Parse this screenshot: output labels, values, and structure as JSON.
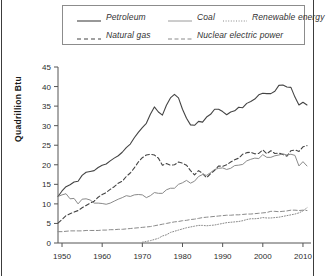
{
  "figure": {
    "ylabel": "Quadrillion Btu"
  },
  "legend": {
    "entries": [
      {
        "label": "Petroleum",
        "style": "solid",
        "color": "#444444",
        "icon": "legend-line-solid"
      },
      {
        "label": "Coal",
        "style": "solid-light",
        "color": "#8a8a8a",
        "icon": "legend-line-solid"
      },
      {
        "label": "Renewable energy",
        "style": "dotted",
        "color": "#8a8a8a",
        "icon": "legend-line-dotted"
      },
      {
        "label": "Natural gas",
        "style": "dashed",
        "color": "#444444",
        "icon": "legend-line-dashed"
      },
      {
        "label": "Nuclear electric power",
        "style": "dash-dot",
        "color": "#8a8a8a",
        "icon": "legend-line-dashdot"
      }
    ]
  },
  "chart_data": {
    "type": "line",
    "title": "",
    "xlabel": "",
    "ylabel": "Quadrillion Btu",
    "xlim": [
      1949,
      2012
    ],
    "ylim": [
      0,
      45
    ],
    "ytick_labels": [
      "0",
      "5",
      "10",
      "15",
      "20",
      "25",
      "30",
      "35",
      "40",
      "45"
    ],
    "yticks": [
      0,
      5,
      10,
      15,
      20,
      25,
      30,
      35,
      40,
      45
    ],
    "xtick_labels": [
      "1950",
      "1960",
      "1970",
      "1980",
      "1990",
      "2000",
      "2010"
    ],
    "xticks": [
      1950,
      1960,
      1970,
      1980,
      1990,
      2000,
      2010
    ],
    "grid": false,
    "legend_position": "top",
    "x": [
      1949,
      1950,
      1951,
      1952,
      1953,
      1954,
      1955,
      1956,
      1957,
      1958,
      1959,
      1960,
      1961,
      1962,
      1963,
      1964,
      1965,
      1966,
      1967,
      1968,
      1969,
      1970,
      1971,
      1972,
      1973,
      1974,
      1975,
      1976,
      1977,
      1978,
      1979,
      1980,
      1981,
      1982,
      1983,
      1984,
      1985,
      1986,
      1987,
      1988,
      1989,
      1990,
      1991,
      1992,
      1993,
      1994,
      1995,
      1996,
      1997,
      1998,
      1999,
      2000,
      2001,
      2002,
      2003,
      2004,
      2005,
      2006,
      2007,
      2008,
      2009,
      2010,
      2011
    ],
    "series": [
      {
        "name": "Petroleum",
        "style": "solid",
        "color": "#444444",
        "values": [
          11.9,
          13.3,
          14.4,
          14.9,
          15.6,
          15.8,
          17.3,
          18.1,
          18.3,
          18.5,
          19.3,
          19.9,
          20.2,
          21.0,
          21.7,
          22.3,
          23.2,
          24.4,
          25.3,
          26.9,
          28.3,
          29.5,
          30.6,
          32.9,
          34.8,
          33.5,
          32.7,
          35.2,
          37.1,
          38.0,
          37.1,
          34.2,
          31.9,
          30.2,
          30.1,
          31.1,
          30.9,
          32.2,
          32.9,
          34.2,
          34.2,
          33.6,
          32.8,
          33.5,
          33.8,
          34.7,
          34.6,
          35.7,
          36.2,
          36.8,
          37.9,
          38.3,
          38.2,
          38.2,
          38.8,
          40.3,
          40.4,
          39.9,
          39.8,
          37.3,
          35.3,
          36.0,
          35.3
        ]
      },
      {
        "name": "Natural gas",
        "style": "dashed",
        "color": "#444444",
        "values": [
          5.1,
          6.0,
          7.0,
          7.5,
          7.9,
          8.3,
          9.0,
          9.6,
          10.2,
          10.7,
          11.7,
          12.4,
          12.9,
          13.7,
          14.4,
          15.3,
          15.8,
          17.0,
          17.9,
          19.2,
          20.7,
          21.8,
          22.5,
          22.7,
          22.5,
          21.7,
          19.9,
          20.3,
          19.9,
          20.0,
          20.7,
          20.4,
          19.9,
          18.5,
          17.4,
          18.5,
          17.8,
          16.7,
          17.7,
          18.6,
          19.7,
          19.6,
          20.0,
          20.7,
          21.3,
          21.7,
          22.7,
          23.1,
          23.2,
          22.8,
          22.9,
          23.8,
          22.8,
          23.6,
          22.9,
          23.0,
          22.6,
          22.2,
          23.6,
          23.8,
          23.4,
          24.6,
          24.9
        ]
      },
      {
        "name": "Coal",
        "style": "solid-light",
        "color": "#8a8a8a",
        "values": [
          11.9,
          12.3,
          12.6,
          11.3,
          11.4,
          10.0,
          11.2,
          11.3,
          11.0,
          10.2,
          10.2,
          10.1,
          9.9,
          10.2,
          10.7,
          11.2,
          11.6,
          12.1,
          11.9,
          12.3,
          12.4,
          12.3,
          11.6,
          12.1,
          12.9,
          12.7,
          12.7,
          13.6,
          14.0,
          14.0,
          15.0,
          15.4,
          16.0,
          15.3,
          15.8,
          17.0,
          17.5,
          17.3,
          18.0,
          18.8,
          19.1,
          19.2,
          18.8,
          19.1,
          19.8,
          19.9,
          20.1,
          21.0,
          21.4,
          21.7,
          21.6,
          22.6,
          21.9,
          21.9,
          22.3,
          22.5,
          22.8,
          22.5,
          22.7,
          22.4,
          19.7,
          20.8,
          19.7
        ]
      },
      {
        "name": "Nuclear electric power",
        "style": "dash-dot",
        "color": "#8a8a8a",
        "values": [
          2.9,
          2.9,
          3.0,
          3.1,
          3.1,
          3.1,
          3.1,
          3.2,
          3.2,
          3.2,
          3.2,
          3.3,
          3.3,
          3.4,
          3.4,
          3.5,
          3.5,
          3.6,
          3.7,
          3.8,
          3.9,
          4.0,
          4.1,
          4.2,
          4.4,
          4.6,
          4.8,
          5.0,
          5.2,
          5.4,
          5.5,
          5.7,
          5.8,
          6.0,
          6.1,
          6.3,
          6.5,
          6.6,
          6.7,
          6.8,
          6.9,
          7.0,
          7.1,
          7.1,
          7.2,
          7.2,
          7.3,
          7.4,
          7.4,
          7.5,
          7.6,
          7.7,
          7.8,
          8.1,
          8.1,
          8.0,
          8.1,
          8.2,
          8.4,
          8.4,
          8.3,
          8.4,
          8.3
        ]
      },
      {
        "name": "Renewable energy",
        "style": "dotted",
        "color": "#8a8a8a",
        "values": [
          0.0,
          0.0,
          0.0,
          0.0,
          0.0,
          0.0,
          0.0,
          0.0,
          0.0,
          0.0,
          0.0,
          0.0,
          0.0,
          0.0,
          0.0,
          0.0,
          0.0,
          0.0,
          0.0,
          0.0,
          0.0,
          0.2,
          0.4,
          0.6,
          0.9,
          1.2,
          1.8,
          2.1,
          2.7,
          3.0,
          3.3,
          3.6,
          3.9,
          4.1,
          4.3,
          4.5,
          4.5,
          4.4,
          4.5,
          4.6,
          4.8,
          5.0,
          5.2,
          5.3,
          5.4,
          5.5,
          5.7,
          6.0,
          6.2,
          6.2,
          6.3,
          6.5,
          6.4,
          6.4,
          6.5,
          6.6,
          6.8,
          7.0,
          7.2,
          7.4,
          7.7,
          8.2,
          9.0
        ]
      }
    ]
  }
}
